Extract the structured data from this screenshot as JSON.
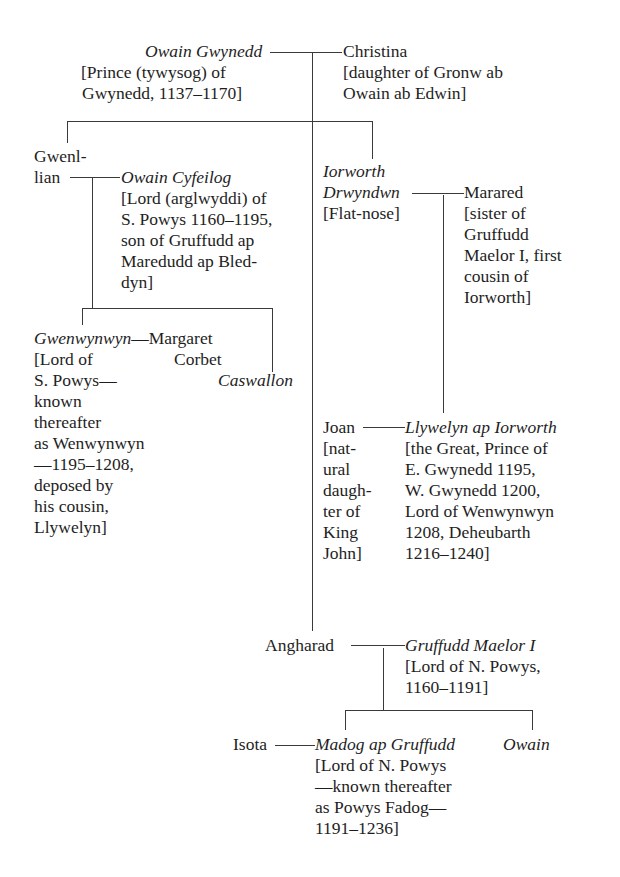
{
  "diagram": {
    "type": "family-tree",
    "people": {
      "owain_gwynedd": {
        "name": "Owain Gwynedd",
        "note": [
          "[Prince (tywysog) of",
          "Gwynedd, 1137–1170]"
        ]
      },
      "christina": {
        "name": "Christina",
        "note": [
          "[daughter of Gronw ab",
          "Owain ab Edwin]"
        ]
      },
      "gwenllian": {
        "name": [
          "Gwenl-",
          "lian"
        ]
      },
      "owain_cyfeilog": {
        "name": "Owain Cyfeilog",
        "note": [
          "[Lord (arglwyddi) of",
          "S. Powys 1160–1195,",
          "son of Gruffudd ap",
          "Maredudd ap Bled-",
          "dyn]"
        ]
      },
      "iorworth": {
        "name": [
          "Iorworth",
          "Drwyndwn"
        ],
        "note": [
          "[Flat-nose]"
        ]
      },
      "marared": {
        "name": "Marared",
        "note": [
          "[sister of",
          "Gruffudd",
          "Maelor I, first",
          "cousin of",
          "Iorworth]"
        ]
      },
      "gwenwynwyn": {
        "name": "Gwenwynwyn",
        "note": [
          "[Lord of",
          "S. Powys—",
          "known",
          "thereafter",
          "as Wenwynwyn",
          "—1195–1208,",
          "deposed by",
          "his cousin,",
          "Llywelyn]"
        ]
      },
      "margaret": {
        "name": [
          "Margaret",
          "Corbet"
        ]
      },
      "caswallon": {
        "name": "Caswallon"
      },
      "joan": {
        "name": "Joan",
        "note": [
          "[nat-",
          "ural",
          "daugh-",
          "ter of",
          "King",
          "John]"
        ]
      },
      "llywelyn": {
        "name": "Llywelyn ap Iorworth",
        "note": [
          "[the Great, Prince of",
          "E. Gwynedd 1195,",
          "W. Gwynedd 1200,",
          "Lord of Wenwynwyn",
          "1208, Deheubarth",
          "1216–1240]"
        ]
      },
      "angharad": {
        "name": "Angharad"
      },
      "gruffudd_maelor": {
        "name": "Gruffudd Maelor I",
        "note": [
          "[Lord of N. Powys,",
          "1160–1191]"
        ]
      },
      "isota": {
        "name": "Isota"
      },
      "madog": {
        "name": "Madog ap Gruffudd",
        "note": [
          "[Lord of N. Powys",
          "—known thereafter",
          "as Powys Fadog—",
          "1191–1236]"
        ]
      },
      "owain": {
        "name": "Owain"
      }
    },
    "dashes": {
      "gwenwynwyn_margaret": "—"
    }
  }
}
